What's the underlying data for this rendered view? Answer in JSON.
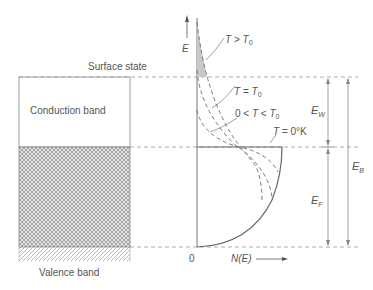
{
  "figure": {
    "axis": {
      "y_label": "E",
      "x_label": "N(E)",
      "origin_label": "0"
    },
    "band_diagram": {
      "surface_label": "Surface state",
      "conduction_label": "Conduction band",
      "valence_label": "Valence band"
    },
    "curves": [
      {
        "label_T": "T",
        "label_rel": ">",
        "label_T0": "T",
        "label_sub": "0",
        "text": "T > T0",
        "style": "dashed"
      },
      {
        "label_T": "T",
        "label_rel": "=",
        "label_T0": "T",
        "label_sub": "0",
        "text": "T = T0",
        "style": "dashed"
      },
      {
        "label_pre": "0 <",
        "label_T": "T",
        "label_rel": "<",
        "label_T0": "T",
        "label_sub": "0",
        "text": "0 < T < T0",
        "style": "dashed"
      },
      {
        "label_T": "T",
        "label_rel": "=",
        "label_val": "0°K",
        "text": "T = 0°K",
        "style": "solid"
      }
    ],
    "dimensions": {
      "ew": {
        "main": "E",
        "sub": "W"
      },
      "ef": {
        "main": "E",
        "sub": "F"
      },
      "eb": {
        "main": "E",
        "sub": "B"
      }
    },
    "colors": {
      "line": "#666666",
      "dash": "#888888",
      "shade": "#c8c8c8"
    }
  }
}
